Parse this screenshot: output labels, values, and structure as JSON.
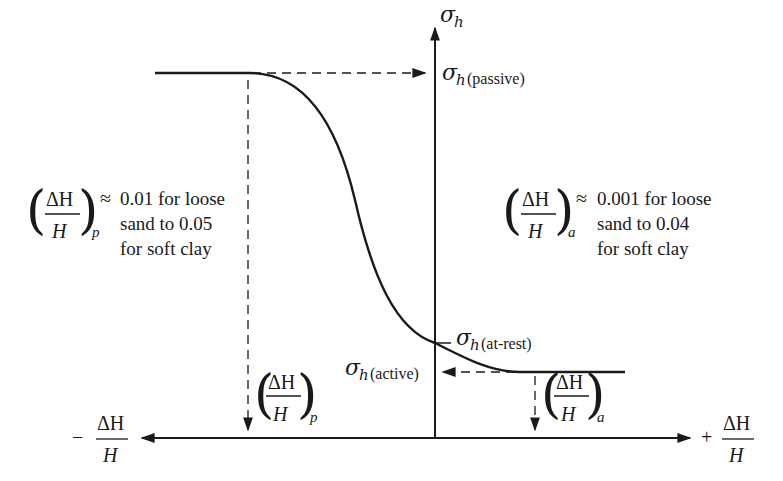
{
  "diagram": {
    "type": "lateral-earth-pressure-vs-wall-movement",
    "axes": {
      "vertical": {
        "label_symbol": "σ",
        "label_subscript": "h"
      },
      "horizontal_negative": {
        "sign": "−",
        "numerator": "ΔH",
        "denominator": "H"
      },
      "horizontal_positive": {
        "sign": "+",
        "numerator": "ΔH",
        "denominator": "H"
      }
    },
    "levels": {
      "passive": {
        "symbol": "σ",
        "subscript": "h",
        "qualifier": "(passive)"
      },
      "at_rest": {
        "symbol": "σ",
        "subscript": "h",
        "qualifier": "(at-rest)"
      },
      "active": {
        "symbol": "σ",
        "subscript": "h",
        "qualifier": "(active)"
      }
    },
    "strain_markers": {
      "passive": {
        "numerator": "ΔH",
        "denominator": "H",
        "subscript": "p"
      },
      "active": {
        "numerator": "ΔH",
        "denominator": "H",
        "subscript": "a"
      }
    },
    "notes": {
      "passive": {
        "numerator": "ΔH",
        "denominator": "H",
        "subscript": "p",
        "approx": "≈",
        "lines": [
          "0.01 for loose",
          "sand to 0.05",
          "for soft clay"
        ]
      },
      "active": {
        "numerator": "ΔH",
        "denominator": "H",
        "subscript": "a",
        "approx": "≈",
        "lines": [
          "0.001 for loose",
          "sand to 0.04",
          "for soft clay"
        ]
      }
    },
    "colors": {
      "ink": "#1a1a1a",
      "background": "#ffffff"
    }
  }
}
